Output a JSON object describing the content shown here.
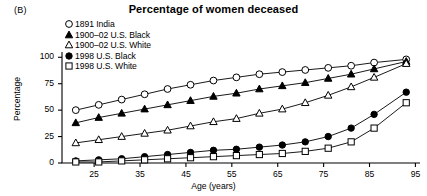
{
  "panel": {
    "label": "(B)"
  },
  "chart_data": {
    "type": "line",
    "title": "Percentage of women deceased",
    "xlabel": "Age (years)",
    "ylabel": "Percentage",
    "xlim": [
      18,
      96
    ],
    "ylim": [
      0,
      105
    ],
    "xticks": [
      25,
      35,
      45,
      55,
      65,
      75,
      85,
      95
    ],
    "yticks": [
      0,
      25,
      50,
      75,
      100
    ],
    "grid": false,
    "legend_position": "top-left",
    "x": [
      21,
      26,
      31,
      36,
      41,
      46,
      51,
      56,
      61,
      66,
      71,
      76,
      81,
      86,
      93
    ],
    "series": [
      {
        "name": "1891 India",
        "marker": "open-circle",
        "values": [
          50,
          55,
          60,
          65,
          70,
          74,
          78,
          81,
          84,
          86,
          88,
          90,
          92,
          95,
          98
        ]
      },
      {
        "name": "1900–02 U.S. Black",
        "marker": "filled-triangle",
        "values": [
          38,
          43,
          47,
          51,
          55,
          59,
          63,
          66,
          70,
          73,
          76,
          80,
          84,
          89,
          96
        ]
      },
      {
        "name": "1900–02 U.S. White",
        "marker": "open-triangle",
        "values": [
          19,
          22,
          25,
          28,
          31,
          35,
          39,
          42,
          47,
          51,
          57,
          64,
          72,
          81,
          94
        ]
      },
      {
        "name": "1998 U.S. Black",
        "marker": "filled-circle",
        "values": [
          2,
          3,
          4,
          6,
          8,
          10,
          12,
          13,
          15,
          17,
          20,
          25,
          33,
          46,
          67
        ]
      },
      {
        "name": "1998 U.S. White",
        "marker": "open-square",
        "values": [
          1,
          1,
          2,
          3,
          4,
          5,
          6,
          7,
          8,
          9,
          11,
          14,
          20,
          33,
          57
        ]
      }
    ]
  }
}
